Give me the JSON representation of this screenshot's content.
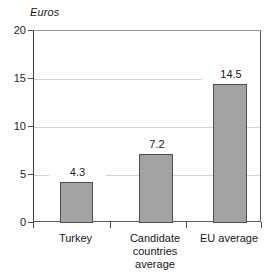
{
  "chart_data": {
    "type": "bar",
    "title": "",
    "subtitle": "",
    "xlabel": "",
    "ylabel": "Euros",
    "ylim": [
      0,
      20
    ],
    "yticks": [
      0,
      5,
      10,
      15,
      20
    ],
    "ytick_labels": [
      "0",
      "5",
      "10",
      "15",
      "20"
    ],
    "grid": true,
    "legend": "none",
    "categories": [
      "Turkey",
      "Candidate countries average",
      "EU average"
    ],
    "category_label_lines": [
      [
        "Turkey"
      ],
      [
        "Candidate",
        "countries",
        "average"
      ],
      [
        "EU average"
      ]
    ],
    "values": [
      4.3,
      7.2,
      14.5
    ],
    "value_labels": [
      "4.3",
      "7.2",
      "14.5"
    ],
    "bar_color": "#a3a3a3",
    "bar_border_color": "#4d4d4d",
    "grid_color": "#d2d2d2",
    "axis_color": "#4a4a4a",
    "background": "#ffffff"
  }
}
